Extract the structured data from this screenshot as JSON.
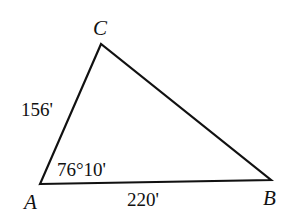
{
  "diagram": {
    "type": "triangle",
    "vertices": [
      {
        "name": "A",
        "x": 40,
        "y": 184
      },
      {
        "name": "B",
        "x": 271,
        "y": 180
      },
      {
        "name": "C",
        "x": 101,
        "y": 44
      }
    ],
    "labels": {
      "vertex_a": "A",
      "vertex_b": "B",
      "vertex_c": "C",
      "side_ac": "156'",
      "side_ab": "220'",
      "angle_a": "76°10'"
    },
    "stroke_color": "#111111"
  }
}
